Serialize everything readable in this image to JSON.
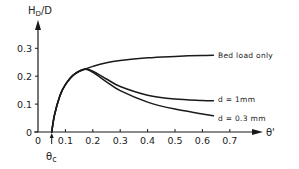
{
  "chart_data": {
    "type": "line",
    "title": "",
    "xlabel": "θ'",
    "ylabel": "H_D/D",
    "xlim": [
      0,
      0.8
    ],
    "ylim": [
      0,
      0.37
    ],
    "grid": false,
    "legend_position": "inline-right",
    "x_ticks": [
      "0",
      "0.1",
      "0.2",
      "0.3",
      "0.4",
      "0.5",
      "0.6",
      "0.7"
    ],
    "y_ticks": [
      "0",
      "0.1",
      "0.2",
      "0.3"
    ],
    "annotations": [
      {
        "text": "θc",
        "x": 0.05,
        "y": 0,
        "note": "critical Shields parameter marked with arrow on x-axis"
      }
    ],
    "series": [
      {
        "name": "Bed load only",
        "x": [
          0.05,
          0.06,
          0.08,
          0.1,
          0.13,
          0.17,
          0.2,
          0.25,
          0.3,
          0.4,
          0.5,
          0.6,
          0.64
        ],
        "values": [
          0.0,
          0.06,
          0.13,
          0.17,
          0.205,
          0.225,
          0.235,
          0.248,
          0.256,
          0.266,
          0.271,
          0.274,
          0.275
        ]
      },
      {
        "name": "d = 1mm",
        "x": [
          0.05,
          0.06,
          0.08,
          0.1,
          0.13,
          0.17,
          0.2,
          0.25,
          0.3,
          0.4,
          0.5,
          0.6,
          0.64
        ],
        "values": [
          0.0,
          0.06,
          0.13,
          0.17,
          0.205,
          0.225,
          0.218,
          0.19,
          0.163,
          0.132,
          0.118,
          0.113,
          0.112
        ]
      },
      {
        "name": "d = 0.3 mm",
        "x": [
          0.05,
          0.06,
          0.08,
          0.1,
          0.13,
          0.17,
          0.2,
          0.25,
          0.3,
          0.4,
          0.5,
          0.6,
          0.64
        ],
        "values": [
          0.0,
          0.06,
          0.13,
          0.17,
          0.205,
          0.225,
          0.214,
          0.18,
          0.148,
          0.107,
          0.082,
          0.065,
          0.058
        ]
      }
    ]
  },
  "labels": {
    "y_axis": "H",
    "y_axis_sub": "D",
    "y_axis_suffix": "/D",
    "x_axis": "θ'",
    "theta_c": "θ",
    "theta_c_sub": "c",
    "series_bed": "Bed load only",
    "series_1mm": "d = 1mm",
    "series_03mm": "d = 0.3 mm"
  }
}
